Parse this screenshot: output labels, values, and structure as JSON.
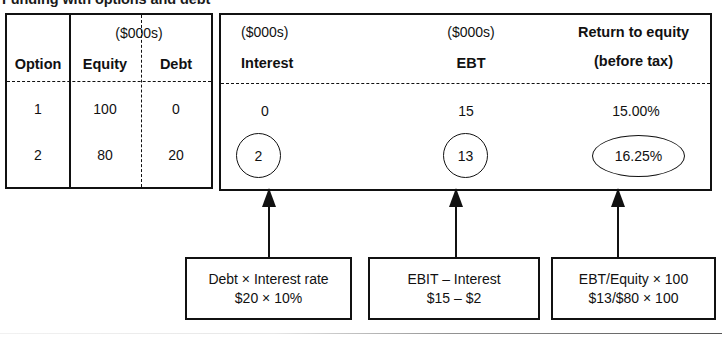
{
  "figure": {
    "title_partial": "Funding with options and debt",
    "bottom_rule": true
  },
  "left_table": {
    "unit_header": "($000s)",
    "columns": [
      "Option",
      "Equity",
      "Debt"
    ],
    "rows": [
      {
        "option": "1",
        "equity": "100",
        "debt": "0"
      },
      {
        "option": "2",
        "equity": "80",
        "debt": "20"
      }
    ]
  },
  "right_panel": {
    "columns": [
      {
        "unit": "($000s)",
        "label": "Interest"
      },
      {
        "unit": "($000s)",
        "label": "EBT"
      },
      {
        "unit": "Return to equity",
        "label": "(before tax)"
      }
    ],
    "rows": [
      {
        "interest": "0",
        "ebt": "15",
        "return_to_equity": "15.00%"
      },
      {
        "interest": "2",
        "ebt": "13",
        "return_to_equity": "16.25%"
      }
    ],
    "highlighted_row_index": 1
  },
  "formula_boxes": [
    {
      "line1": "Debt × Interest rate",
      "line2": "$20 × 10%"
    },
    {
      "line1": "EBIT – Interest",
      "line2": "$15 – $2"
    },
    {
      "line1": "EBT/Equity × 100",
      "line2": "$13/$80 × 100"
    }
  ]
}
